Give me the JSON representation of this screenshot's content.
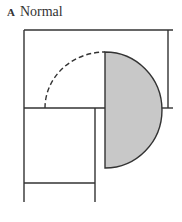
{
  "figure": {
    "panel_letter": "A",
    "panel_title": "Normal"
  },
  "colors": {
    "line": "#333333",
    "fill": "#c8c8c8",
    "background": "#ffffff"
  }
}
